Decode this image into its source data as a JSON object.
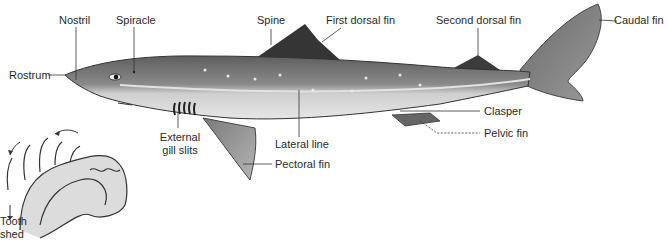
{
  "diagram": {
    "labels": {
      "nostril": "Nostril",
      "spiracle": "Spiracle",
      "spine": "Spine",
      "first_dorsal_fin": "First dorsal fin",
      "second_dorsal_fin": "Second dorsal fin",
      "caudal_fin": "Caudal fin",
      "rostrum": "Rostrum",
      "clasper": "Clasper",
      "pelvic_fin": "Pelvic fin",
      "external_gill_slits_1": "External",
      "external_gill_slits_2": "gill slits",
      "lateral_line": "Lateral line",
      "pectoral_fin": "Pectoral fin",
      "tooth_shed_1": "Tooth",
      "tooth_shed_2": "shed"
    },
    "colors": {
      "body_dark": "#6e6e6e",
      "body_light": "#d8d8d8",
      "fin_dark": "#3a3a3a",
      "line": "#333333"
    }
  }
}
